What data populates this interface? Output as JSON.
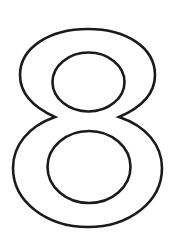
{
  "graphic": {
    "label": "8",
    "description": "Outlined numeral eight",
    "colors": {
      "background": "#ffffff",
      "stroke": "#1a1a1a",
      "fill": "#ffffff"
    }
  }
}
